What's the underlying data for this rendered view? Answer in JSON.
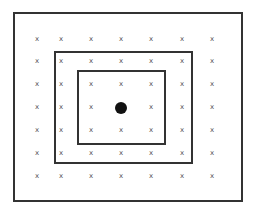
{
  "diagram": {
    "boxes": [
      {
        "name": "outer-box",
        "x": 13,
        "y": 12,
        "w": 230,
        "h": 190
      },
      {
        "name": "middle-box",
        "x": 54,
        "y": 51,
        "w": 139,
        "h": 113
      },
      {
        "name": "inner-box",
        "x": 77,
        "y": 70,
        "w": 89,
        "h": 75
      }
    ],
    "grid": {
      "marker": "x",
      "columns": [
        37,
        61,
        91,
        121,
        151,
        182,
        212
      ],
      "rows": [
        39,
        61,
        84,
        107,
        130,
        153,
        176
      ]
    },
    "center_dot": {
      "x": 121,
      "y": 108,
      "r": 6,
      "color": "#111111"
    },
    "line_color": "#333333"
  }
}
